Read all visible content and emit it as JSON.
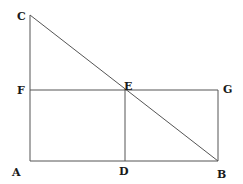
{
  "diagram": {
    "type": "geometric-figure",
    "points": {
      "A": {
        "label": "A",
        "x": 30,
        "y": 161
      },
      "B": {
        "label": "B",
        "x": 218,
        "y": 161
      },
      "C": {
        "label": "C",
        "x": 30,
        "y": 15
      },
      "D": {
        "label": "D",
        "x": 125,
        "y": 161
      },
      "E": {
        "label": "E",
        "x": 125,
        "y": 90
      },
      "F": {
        "label": "F",
        "x": 30,
        "y": 90
      },
      "G": {
        "label": "G",
        "x": 218,
        "y": 90
      }
    },
    "segments": [
      [
        "A",
        "C"
      ],
      [
        "A",
        "B"
      ],
      [
        "C",
        "B"
      ],
      [
        "F",
        "G"
      ],
      [
        "E",
        "D"
      ],
      [
        "G",
        "B"
      ]
    ],
    "labels": {
      "A": "A",
      "B": "B",
      "C": "C",
      "D": "D",
      "E": "E",
      "F": "F",
      "G": "G"
    },
    "colors": {
      "line": "#555555",
      "text": "#1a1a1a",
      "background": "#ffffff"
    }
  }
}
